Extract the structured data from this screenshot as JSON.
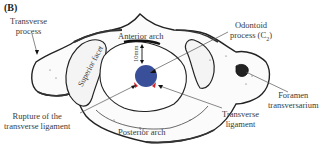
{
  "panel_label": "(B)",
  "figure": {
    "labels": {
      "transverse_process_1": "Transverse",
      "transverse_process_2": "process",
      "anterior_arch": "Anterior arch",
      "odontoid_1": "Odontoid",
      "odontoid_2": "process (C",
      "odontoid_sub": "2",
      "odontoid_close": ")",
      "superior_facet": "Superior facet",
      "measurement": "10mm",
      "foramen_1": "Foramen",
      "foramen_2": "transversarium",
      "rupture_1": "Rupture of the",
      "rupture_2": "transverse ligament",
      "transverse_lig_1": "Transverse",
      "transverse_lig_2": "ligament",
      "posterior_arch": "Posterior arch"
    },
    "colors": {
      "odontoid_fill": "#3a4f9a",
      "rupture_marks": "#d2232a",
      "bone_outline": "#222222",
      "label_text": "#3a3a3a",
      "leader_lines": "#555555"
    }
  }
}
